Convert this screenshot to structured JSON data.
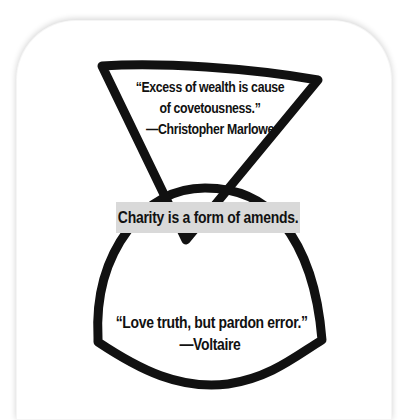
{
  "top_quote": {
    "lines": [
      "“Excess of wealth is cause",
      "of covetousness.”"
    ],
    "attribution": "—Christopher Marlowe"
  },
  "banner": {
    "text": "Charity is a form of amends.",
    "background": "#d9d9d9"
  },
  "bottom_quote": {
    "lines": [
      "“Love truth, but pardon error.”"
    ],
    "attribution": "—Voltaire"
  },
  "shapes": {
    "stroke_color": "#111111",
    "top_shape": "inverted-triangle",
    "bottom_shape": "rounded-arch"
  }
}
